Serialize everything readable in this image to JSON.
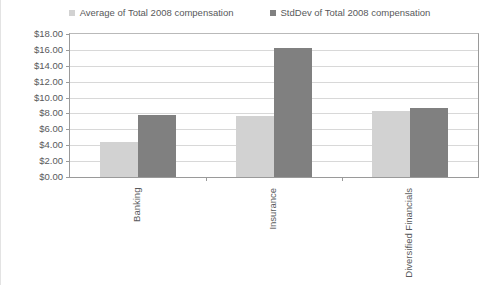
{
  "chart_data": {
    "type": "bar",
    "title": "",
    "subtitle": "",
    "xlabel": "",
    "ylabel": "",
    "categories": [
      "Banking",
      "Insurance",
      "Diversified Financials"
    ],
    "series": [
      {
        "name": "Average of Total 2008 compensation",
        "color": "#d2d2d2",
        "values": [
          4.4,
          7.7,
          8.3
        ]
      },
      {
        "name": "StdDev of Total 2008 compensation",
        "color": "#808080",
        "values": [
          7.8,
          16.3,
          8.7
        ]
      }
    ],
    "ylim": [
      0,
      18
    ],
    "ytick_step": 2,
    "ytick_labels": [
      "$0.00",
      "$2.00",
      "$4.00",
      "$6.00",
      "$8.00",
      "$10.00",
      "$12.00",
      "$14.00",
      "$16.00",
      "$18.00"
    ],
    "grid": true,
    "legend_position": "top"
  },
  "legend": {
    "entries": [
      {
        "label": "Average of Total 2008 compensation",
        "color": "#d2d2d2"
      },
      {
        "label": "StdDev of Total 2008 compensation",
        "color": "#808080"
      }
    ]
  }
}
